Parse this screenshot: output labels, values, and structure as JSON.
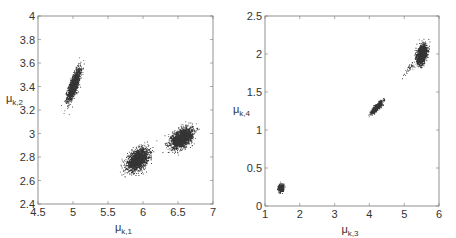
{
  "chart_data": [
    {
      "type": "scatter",
      "title": "",
      "xlabel": "μk,1",
      "ylabel": "μk,2",
      "xlabel_main": "μ",
      "xlabel_sub": "k,1",
      "ylabel_main": "μ",
      "ylabel_sub": "k,2",
      "xlim": [
        4.5,
        7
      ],
      "ylim": [
        2.4,
        4
      ],
      "xticks": [
        4.5,
        5,
        5.5,
        6,
        6.5,
        7
      ],
      "xtick_labels": [
        "4.5",
        "5",
        "5.5",
        "6",
        "6.5",
        "7"
      ],
      "yticks": [
        2.4,
        2.6,
        2.8,
        3,
        3.2,
        3.4,
        3.6,
        3.8,
        4
      ],
      "ytick_labels": [
        "2.4",
        "2.6",
        "2.8",
        "3",
        "3.2",
        "3.4",
        "3.6",
        "3.8",
        "4"
      ],
      "grid": false,
      "legend": null,
      "box": {
        "left": 38,
        "right": 213,
        "top": 16,
        "bottom": 204
      },
      "clusters": [
        {
          "name": "cluster-1",
          "cx": 5.01,
          "cy": 3.42,
          "sx": 0.045,
          "sy": 0.065,
          "rho": 0.75,
          "n": 1600
        },
        {
          "name": "cluster-2",
          "cx": 5.92,
          "cy": 2.78,
          "sx": 0.075,
          "sy": 0.045,
          "rho": 0.45,
          "n": 1900
        },
        {
          "name": "cluster-3",
          "cx": 6.55,
          "cy": 2.965,
          "sx": 0.075,
          "sy": 0.042,
          "rho": 0.45,
          "n": 1900
        }
      ]
    },
    {
      "type": "scatter",
      "title": "",
      "xlabel": "μk,3",
      "ylabel": "μk,4",
      "xlabel_main": "μ",
      "xlabel_sub": "k,3",
      "ylabel_main": "μ",
      "ylabel_sub": "k,4",
      "xlim": [
        1,
        6
      ],
      "ylim": [
        0,
        2.5
      ],
      "xticks": [
        1,
        2,
        3,
        4,
        5,
        6
      ],
      "xtick_labels": [
        "1",
        "2",
        "3",
        "4",
        "5",
        "6"
      ],
      "yticks": [
        0,
        0.5,
        1,
        1.5,
        2,
        2.5
      ],
      "ytick_labels": [
        "0",
        "0.5",
        "1",
        "1.5",
        "2",
        "2.5"
      ],
      "grid": false,
      "legend": null,
      "box": {
        "left": 265,
        "right": 439,
        "top": 16,
        "bottom": 206
      },
      "clusters": [
        {
          "name": "cluster-1",
          "cx": 1.45,
          "cy": 0.24,
          "sx": 0.035,
          "sy": 0.022,
          "rho": 0.2,
          "n": 900
        },
        {
          "name": "cluster-2",
          "cx": 4.2,
          "cy": 1.3,
          "sx": 0.07,
          "sy": 0.035,
          "rho": 0.85,
          "n": 1300
        },
        {
          "name": "cluster-3",
          "cx": 5.5,
          "cy": 2.0,
          "sx": 0.07,
          "sy": 0.06,
          "rho": 0.35,
          "n": 1800
        },
        {
          "name": "tail",
          "cx": 5.15,
          "cy": 1.82,
          "sx": 0.1,
          "sy": 0.055,
          "rho": 0.9,
          "n": 40
        }
      ]
    }
  ]
}
